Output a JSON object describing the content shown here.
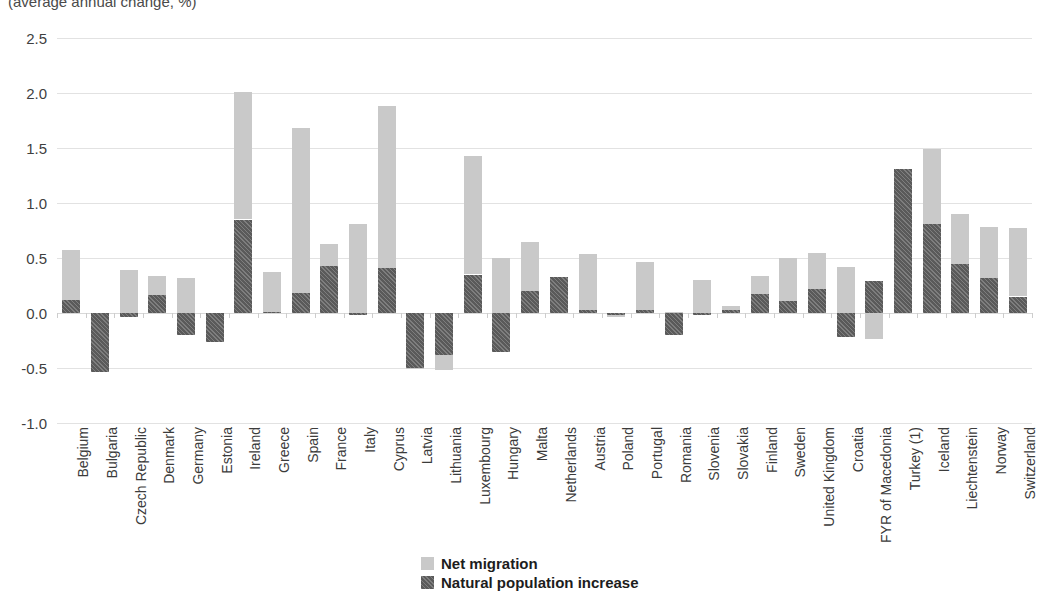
{
  "subtitle": "(average annual change, %)",
  "legend": {
    "position": "bottom-center",
    "items": [
      {
        "label": "Net migration",
        "key": "net_migration",
        "color": "#c9c9c9"
      },
      {
        "label": "Natural population increase",
        "key": "natural_increase",
        "color": "#5a5a5a"
      }
    ]
  },
  "chart_data": {
    "type": "bar",
    "stacked": true,
    "title": "",
    "subtitle": "(average annual change, %)",
    "xlabel": "",
    "ylabel": "",
    "ylim": [
      -1.0,
      2.5
    ],
    "yticks": [
      2.5,
      2.0,
      1.5,
      1.0,
      0.5,
      0.0,
      -0.5,
      -1.0
    ],
    "ytick_labels": [
      "2.5",
      "2.0",
      "1.5",
      "1.0",
      "0.5",
      "0.0",
      "-0.5",
      "-1.0"
    ],
    "grid": true,
    "categories": [
      "Belgium",
      "Bulgaria",
      "Czech Republic",
      "Denmark",
      "Germany",
      "Estonia",
      "Ireland",
      "Greece",
      "Spain",
      "France",
      "Italy",
      "Cyprus",
      "Latvia",
      "Lithuania",
      "Luxembourg",
      "Hungary",
      "Malta",
      "Netherlands",
      "Austria",
      "Poland",
      "Portugal",
      "Romania",
      "Slovenia",
      "Slovakia",
      "Finland",
      "Sweden",
      "United Kingdom",
      "Croatia",
      "FYR of Macedonia",
      "Turkey (1)",
      "Iceland",
      "Liechtenstein",
      "Norway",
      "Switzerland"
    ],
    "series": [
      {
        "name": "Natural population increase",
        "key": "natural_increase",
        "color": "#5a5a5a",
        "values": [
          0.12,
          -0.54,
          -0.04,
          0.16,
          -0.2,
          -0.26,
          0.85,
          0.01,
          0.18,
          0.43,
          -0.02,
          0.41,
          -0.5,
          -0.38,
          0.35,
          -0.35,
          0.2,
          0.33,
          0.03,
          -0.02,
          0.03,
          -0.2,
          -0.02,
          0.03,
          0.17,
          0.11,
          0.22,
          -0.22,
          0.29,
          1.31,
          0.81,
          0.45,
          0.32,
          0.15
        ]
      },
      {
        "name": "Net migration",
        "key": "net_migration",
        "color": "#c9c9c9",
        "values": [
          0.45,
          0.0,
          0.39,
          0.18,
          0.32,
          0.0,
          1.16,
          0.36,
          1.5,
          0.2,
          0.81,
          1.47,
          -0.01,
          -0.14,
          1.08,
          0.5,
          0.45,
          0.0,
          0.51,
          -0.02,
          0.43,
          0.01,
          0.3,
          0.03,
          0.17,
          0.39,
          0.33,
          0.42,
          -0.24,
          0.0,
          0.68,
          0.45,
          0.46,
          0.62
        ]
      }
    ],
    "totals": [
      0.57,
      -0.54,
      0.35,
      0.34,
      0.12,
      -0.26,
      2.01,
      0.37,
      1.68,
      0.63,
      0.79,
      1.88,
      -0.51,
      -0.52,
      1.43,
      0.15,
      0.65,
      0.33,
      0.54,
      -0.04,
      0.46,
      -0.19,
      0.28,
      0.06,
      0.34,
      0.5,
      0.55,
      0.2,
      0.05,
      1.31,
      1.49,
      0.9,
      0.78,
      0.77
    ]
  }
}
